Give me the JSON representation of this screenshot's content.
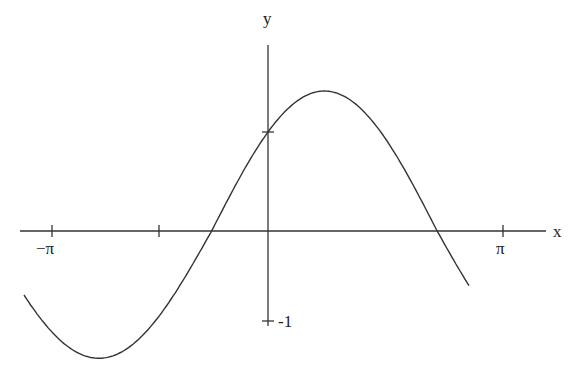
{
  "chart_data": {
    "type": "line",
    "title": "",
    "xlabel": "x",
    "ylabel": "y",
    "function": "sqrt(2)·sin(x + π/4) = sin(x) + cos(x)",
    "xlim": [
      -3.14159,
      3.14159
    ],
    "x_domain_plotted": [
      -3.4,
      2.8
    ],
    "ylim": [
      -1.5,
      1.5
    ],
    "grid": false,
    "legend": null,
    "x_ticks": [
      {
        "value": -3.14159,
        "label": "−π"
      },
      {
        "value": -1.5708,
        "label": ""
      },
      {
        "value": 3.14159,
        "label": "π"
      }
    ],
    "y_ticks": [
      {
        "value": 1,
        "label": ""
      },
      {
        "value": -1,
        "label": "-1"
      }
    ],
    "series": [
      {
        "name": "curve",
        "color": "#333333",
        "x": [
          -3.4,
          -3.0,
          -2.6,
          -2.356,
          -2.0,
          -1.6,
          -1.2,
          -0.785,
          -0.4,
          0,
          0.4,
          0.785,
          1.2,
          1.6,
          2.0,
          2.356,
          2.8
        ],
        "y": [
          -0.71,
          -1.13,
          -1.37,
          -1.41,
          -1.33,
          -1.03,
          -0.57,
          0.0,
          0.53,
          1.0,
          1.31,
          1.41,
          1.29,
          0.97,
          0.49,
          0.0,
          -0.61
        ]
      }
    ]
  },
  "labels": {
    "x_axis": "x",
    "y_axis": "y",
    "neg_pi": "−π",
    "pi": "π",
    "neg_one": "-1"
  },
  "colors": {
    "axis": "#333333",
    "curve": "#333333",
    "background": "#ffffff"
  }
}
